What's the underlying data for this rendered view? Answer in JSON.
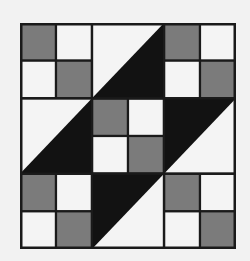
{
  "diagram": {
    "title": "",
    "type": "quilt-block",
    "grid": {
      "cols": 6,
      "rows": 6
    },
    "colors": {
      "background": "#f2f2f2",
      "light": "#f4f4f4",
      "gray": "#7b7b7b",
      "dark": "#121212",
      "line": "#1a1a1a"
    },
    "squares": [
      {
        "col": 0,
        "row": 0,
        "fill": "gray"
      },
      {
        "col": 1,
        "row": 0,
        "fill": "light"
      },
      {
        "col": 0,
        "row": 1,
        "fill": "light"
      },
      {
        "col": 1,
        "row": 1,
        "fill": "gray"
      },
      {
        "col": 4,
        "row": 0,
        "fill": "gray"
      },
      {
        "col": 5,
        "row": 0,
        "fill": "light"
      },
      {
        "col": 4,
        "row": 1,
        "fill": "light"
      },
      {
        "col": 5,
        "row": 1,
        "fill": "gray"
      },
      {
        "col": 2,
        "row": 2,
        "fill": "gray"
      },
      {
        "col": 3,
        "row": 2,
        "fill": "light"
      },
      {
        "col": 2,
        "row": 3,
        "fill": "light"
      },
      {
        "col": 3,
        "row": 3,
        "fill": "gray"
      },
      {
        "col": 0,
        "row": 4,
        "fill": "gray"
      },
      {
        "col": 1,
        "row": 4,
        "fill": "light"
      },
      {
        "col": 0,
        "row": 5,
        "fill": "light"
      },
      {
        "col": 1,
        "row": 5,
        "fill": "gray"
      },
      {
        "col": 4,
        "row": 4,
        "fill": "gray"
      },
      {
        "col": 5,
        "row": 4,
        "fill": "light"
      },
      {
        "col": 4,
        "row": 5,
        "fill": "light"
      },
      {
        "col": 5,
        "row": 5,
        "fill": "gray"
      }
    ],
    "triangle_blocks": [
      {
        "name": "top-middle",
        "col": 2,
        "row": 0,
        "dark": "lower-right"
      },
      {
        "name": "middle-left",
        "col": 0,
        "row": 2,
        "dark": "lower-right"
      },
      {
        "name": "middle-right",
        "col": 4,
        "row": 2,
        "dark": "upper-left"
      },
      {
        "name": "bottom-middle",
        "col": 2,
        "row": 4,
        "dark": "upper-left"
      }
    ]
  }
}
